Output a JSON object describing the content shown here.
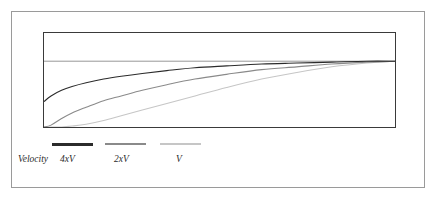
{
  "figure": {
    "background_color": "#ffffff",
    "outer_border_color": "#9a9a9a",
    "plot_border_color": "#3a3a3a"
  },
  "legend": {
    "position": "below-plot",
    "title": "Velocity",
    "entries": [
      {
        "label": "4xV",
        "color": "#2b2b2b",
        "swatch": "line-swatch-dark"
      },
      {
        "label": "2xV",
        "color": "#8a8a8a",
        "swatch": "line-swatch-medium"
      },
      {
        "label": "V",
        "color": "#c6c6c6",
        "swatch": "line-swatch-light"
      }
    ]
  },
  "chart_data": {
    "type": "line",
    "title": "",
    "subtitle": "",
    "xlabel": "",
    "ylabel": "",
    "xlim": [
      0,
      100
    ],
    "ylim": [
      0,
      100
    ],
    "grid": false,
    "legend_position": "bottom-left",
    "axis_ticks_visible": false,
    "tick_labels": {
      "x": [],
      "y": []
    },
    "annotations": [
      {
        "name": "asymptote-line",
        "type": "horizontal-reference-line",
        "y": 70,
        "color": "#8a8a8a",
        "description": "horizontal asymptote that all velocity curves approach"
      }
    ],
    "x": [
      0,
      2,
      5,
      8,
      12,
      17,
      22,
      28,
      35,
      43,
      52,
      62,
      72,
      82,
      92,
      100
    ],
    "series": [
      {
        "name": "4xV",
        "color": "#2b2b2b",
        "values": [
          27,
          33,
          39,
          43,
          47,
          51,
          54,
          57,
          60,
          63,
          65,
          67,
          68,
          69,
          70,
          70
        ]
      },
      {
        "name": "2xV",
        "color": "#8a8a8a",
        "values": [
          0,
          2,
          9,
          15,
          21,
          28,
          33,
          39,
          45,
          51,
          56,
          61,
          64,
          67,
          69,
          70
        ]
      },
      {
        "name": "V",
        "color": "#c6c6c6",
        "values": [
          0,
          0,
          0,
          1,
          3,
          7,
          12,
          18,
          25,
          33,
          42,
          51,
          58,
          64,
          68,
          70
        ]
      }
    ]
  }
}
